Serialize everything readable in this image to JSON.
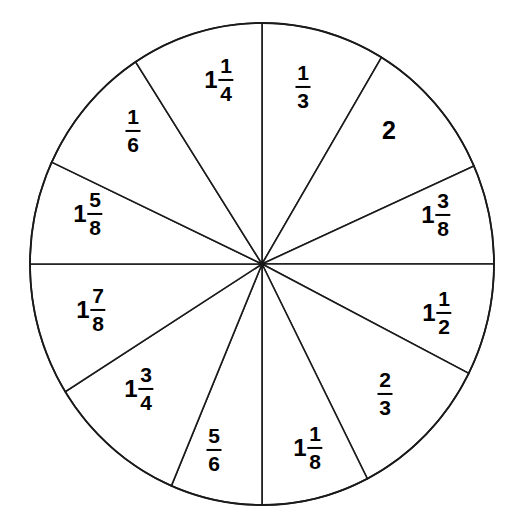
{
  "figure": {
    "type": "pie-wheel-diagram",
    "title": "",
    "background_color": "#ffffff",
    "stroke_color": "#1a1a1a",
    "text_color": "#000000",
    "sector_count": 12
  },
  "chart_data": {
    "type": "pie",
    "title": "",
    "xlabel": "",
    "ylabel": "",
    "legend": "none",
    "grid": false,
    "center": {
      "x": 262,
      "y": 264
    },
    "radius": {
      "x": 232,
      "y": 241
    },
    "categories": [
      "1/3",
      "2",
      "1 3/8",
      "1 1/2",
      "2/3",
      "1 1/8",
      "5/6",
      "1 3/4",
      "1 7/8",
      "1 5/8",
      "1/6",
      "1 1/4"
    ],
    "values": [
      31,
      35,
      24,
      27,
      36,
      23,
      27,
      35,
      32,
      32,
      35,
      33
    ],
    "sectors": [
      {
        "index": 0,
        "label": "1/3",
        "whole": "",
        "numerator": "1",
        "denominator": "3",
        "value": 0.3333,
        "start_angle_deg": 90,
        "end_angle_deg": 59,
        "label_x": 303,
        "label_y": 87
      },
      {
        "index": 1,
        "label": "2",
        "whole": "2",
        "numerator": "",
        "denominator": "",
        "value": 2,
        "start_angle_deg": 59,
        "end_angle_deg": 24,
        "label_x": 389,
        "label_y": 130
      },
      {
        "index": 2,
        "label": "1 3/8",
        "whole": "1",
        "numerator": "3",
        "denominator": "8",
        "value": 1.375,
        "start_angle_deg": 24,
        "end_angle_deg": 0,
        "label_x": 436,
        "label_y": 215
      },
      {
        "index": 3,
        "label": "1 1/2",
        "whole": "1",
        "numerator": "1",
        "denominator": "2",
        "value": 1.5,
        "start_angle_deg": 0,
        "end_angle_deg": -27,
        "label_x": 437,
        "label_y": 313
      },
      {
        "index": 4,
        "label": "2/3",
        "whole": "",
        "numerator": "2",
        "denominator": "3",
        "value": 0.6667,
        "start_angle_deg": -27,
        "end_angle_deg": -63,
        "label_x": 385,
        "label_y": 394
      },
      {
        "index": 5,
        "label": "1 1/8",
        "whole": "1",
        "numerator": "1",
        "denominator": "8",
        "value": 1.125,
        "start_angle_deg": -63,
        "end_angle_deg": -90,
        "label_x": 308,
        "label_y": 448
      },
      {
        "index": 6,
        "label": "5/6",
        "whole": "",
        "numerator": "5",
        "denominator": "6",
        "value": 0.8333,
        "start_angle_deg": -90,
        "end_angle_deg": -113,
        "label_x": 214,
        "label_y": 450
      },
      {
        "index": 7,
        "label": "1 3/4",
        "whole": "1",
        "numerator": "3",
        "denominator": "4",
        "value": 1.75,
        "start_angle_deg": -113,
        "end_angle_deg": -148,
        "label_x": 139,
        "label_y": 389
      },
      {
        "index": 8,
        "label": "1 7/8",
        "whole": "1",
        "numerator": "7",
        "denominator": "8",
        "value": 1.875,
        "start_angle_deg": -148,
        "end_angle_deg": 180,
        "label_x": 91,
        "label_y": 310
      },
      {
        "index": 9,
        "label": "1 5/8",
        "whole": "1",
        "numerator": "5",
        "denominator": "8",
        "value": 1.625,
        "start_angle_deg": 180,
        "end_angle_deg": 155,
        "label_x": 88,
        "label_y": 214
      },
      {
        "index": 10,
        "label": "1/6",
        "whole": "",
        "numerator": "1",
        "denominator": "6",
        "value": 0.1667,
        "start_angle_deg": 155,
        "end_angle_deg": 123,
        "label_x": 133,
        "label_y": 131
      },
      {
        "index": 11,
        "label": "1 1/4",
        "whole": "1",
        "numerator": "1",
        "denominator": "4",
        "value": 1.25,
        "start_angle_deg": 123,
        "end_angle_deg": 90,
        "label_x": 219,
        "label_y": 80
      }
    ]
  }
}
